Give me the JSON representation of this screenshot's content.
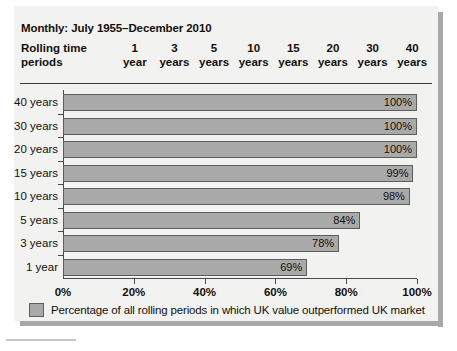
{
  "figure": {
    "title": "Monthly: July 1955–December 2010",
    "row_header": {
      "line1": "Rolling time",
      "line2": "periods"
    },
    "column_headers": [
      {
        "num": "1",
        "unit": "year"
      },
      {
        "num": "3",
        "unit": "years"
      },
      {
        "num": "5",
        "unit": "years"
      },
      {
        "num": "10",
        "unit": "years"
      },
      {
        "num": "15",
        "unit": "years"
      },
      {
        "num": "20",
        "unit": "years"
      },
      {
        "num": "30",
        "unit": "years"
      },
      {
        "num": "40",
        "unit": "years"
      }
    ],
    "legend": {
      "label": "Percentage of all rolling periods in which UK value outperformed UK market",
      "swatch_color": "#a9a9a9",
      "swatch_border": "#5d5d5d"
    },
    "colors": {
      "panel_background": "#f2f2f0",
      "bar_fill": "#a9a9a9",
      "bar_border": "#5d5d5d",
      "axis": "#4a4a4a",
      "text": "#14100c",
      "shadow": "#a8a8a8"
    }
  },
  "chart_data": {
    "type": "bar",
    "orientation": "horizontal",
    "title": "Monthly: July 1955–December 2010",
    "xlabel": "",
    "ylabel": "Rolling time periods",
    "categories": [
      "40 years",
      "30 years",
      "20 years",
      "15 years",
      "10 years",
      "5 years",
      "3 years",
      "1 year"
    ],
    "values": [
      100,
      100,
      100,
      99,
      98,
      84,
      78,
      69
    ],
    "data_labels": [
      "100%",
      "100%",
      "100%",
      "99%",
      "98%",
      "84%",
      "78%",
      "69%"
    ],
    "xlim": [
      0,
      100
    ],
    "xticks": [
      0,
      20,
      40,
      60,
      80,
      100
    ],
    "xticklabels": [
      "0%",
      "20%",
      "40%",
      "60%",
      "80%",
      "100%"
    ],
    "grid": false,
    "legend": [
      "Percentage of all rolling periods in which UK value outperformed UK market"
    ],
    "legend_position": "bottom-left",
    "series": [
      {
        "name": "Percentage of all rolling periods in which UK value outperformed UK market",
        "values": [
          100,
          100,
          100,
          99,
          98,
          84,
          78,
          69
        ]
      }
    ]
  }
}
